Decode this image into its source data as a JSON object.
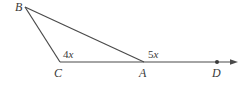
{
  "diagram": {
    "type": "triangle with exterior angle",
    "points": {
      "B": {
        "label": "B",
        "x": 25,
        "y": 7
      },
      "C": {
        "label": "C",
        "x": 60,
        "y": 62
      },
      "A": {
        "label": "A",
        "x": 144,
        "y": 62
      },
      "D": {
        "label": "D",
        "x": 217,
        "y": 62
      }
    },
    "segments": [
      "BC",
      "BA",
      "CA",
      "AD (ray continuing right)"
    ],
    "angles": {
      "C": {
        "coef": "4",
        "var": "x"
      },
      "A_exterior": {
        "coef": "5",
        "var": "x"
      }
    },
    "colors": {
      "stroke": "#4a4a4a",
      "text": "#3a3a3a",
      "background": "#ffffff"
    }
  }
}
